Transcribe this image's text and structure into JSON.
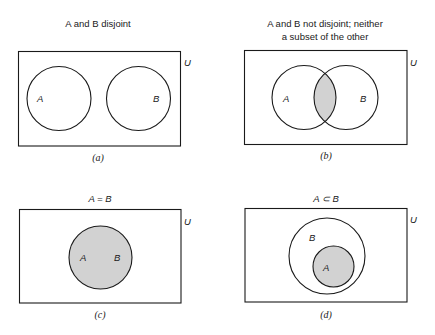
{
  "diagram": {
    "universe_label": "U",
    "fill_color": "#d2d2d2",
    "stroke_color": "#1a1a1a",
    "panels": [
      {
        "id": "a",
        "sublabel": "(a)",
        "title_lines": [
          "A and B disjoint"
        ],
        "relation": "disjoint",
        "sets": [
          {
            "label": "A"
          },
          {
            "label": "B"
          }
        ],
        "shaded": "none"
      },
      {
        "id": "b",
        "sublabel": "(b)",
        "title_lines": [
          "A and B not disjoint; neither",
          "a subset of the other"
        ],
        "relation": "overlap",
        "sets": [
          {
            "label": "A"
          },
          {
            "label": "B"
          }
        ],
        "shaded": "intersection"
      },
      {
        "id": "c",
        "sublabel": "(c)",
        "title_lines": [
          "A = B"
        ],
        "relation": "equal",
        "sets": [
          {
            "label": "A"
          },
          {
            "label": "B"
          }
        ],
        "shaded": "A = B"
      },
      {
        "id": "d",
        "sublabel": "(d)",
        "title_lines": [
          "A ⊂ B"
        ],
        "relation": "subset",
        "sets": [
          {
            "label": "B"
          },
          {
            "label": "A"
          }
        ],
        "shaded": "A"
      }
    ]
  }
}
